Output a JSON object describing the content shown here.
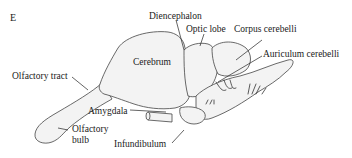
{
  "figure": {
    "panel_letter": "E",
    "labels": {
      "diencephalon": "Diencephalon",
      "optic_lobe": "Optic lobe",
      "corpus_cerebelli": "Corpus cerebelli",
      "auriculum_cerebelli": "Auriculum cerebelli",
      "cerebrum": "Cerebrum",
      "olfactory_tract": "Olfactory tract",
      "amygdala": "Amygdala",
      "olfactory_bulb_line1": "Olfactory",
      "olfactory_bulb_line2": "bulb",
      "infundibulum": "Infundibulum"
    }
  }
}
